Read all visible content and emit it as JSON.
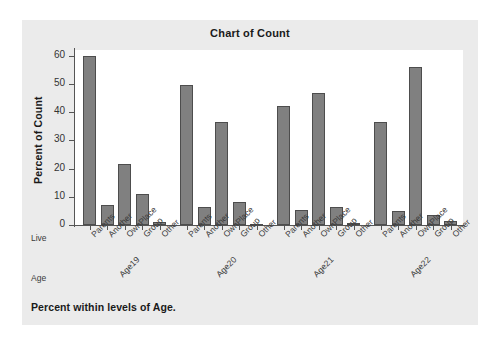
{
  "chart_data": {
    "type": "bar",
    "title": "Chart of Count",
    "xlabel": "",
    "ylabel": "Percent of Count",
    "ylim": [
      0,
      62
    ],
    "yticks": [
      0,
      10,
      20,
      30,
      40,
      50,
      60
    ],
    "grid": false,
    "legend": null,
    "footnote": "Percent within levels of Age.",
    "row_headers": {
      "inner": "Live",
      "outer": "Age"
    },
    "categories": [
      "Parents",
      "Another",
      "OwnPlace",
      "Group",
      "Other"
    ],
    "groups": [
      "Age19",
      "Age20",
      "Age21",
      "Age22"
    ],
    "series": [
      {
        "name": "Age19",
        "values": [
          60.0,
          7.0,
          21.5,
          11.0,
          1.0
        ]
      },
      {
        "name": "Age20",
        "values": [
          49.5,
          6.4,
          36.4,
          8.1,
          0.4
        ]
      },
      {
        "name": "Age21",
        "values": [
          42.2,
          5.4,
          46.6,
          6.5,
          0.8
        ]
      },
      {
        "name": "Age22",
        "values": [
          36.5,
          5.0,
          56.0,
          3.4,
          1.5
        ]
      }
    ],
    "colors": {
      "bar_fill": "#808080",
      "bar_edge": "#4d4d4d",
      "panel_background": "#ebebeb",
      "plot_background": "#ffffff",
      "axis": "#555555",
      "text": "#1a1a1a"
    }
  }
}
